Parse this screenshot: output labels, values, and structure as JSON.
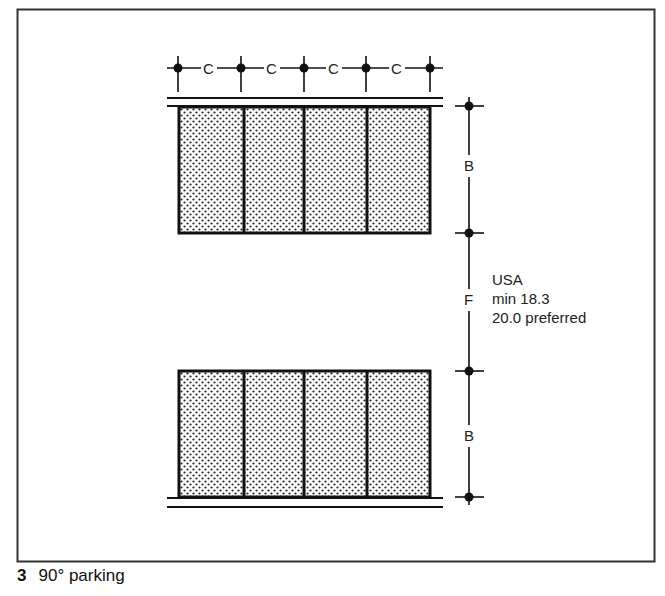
{
  "figure": {
    "number": "3",
    "caption": "90° parking"
  },
  "dimensions": {
    "stall_width_label": "C",
    "stall_depth_label": "B",
    "aisle_width_label": "F",
    "note_lines": [
      "USA",
      "min 18.3",
      "20.0 preferred"
    ]
  },
  "layout": {
    "stalls_per_row": 4,
    "rows": 2,
    "stall_fill": "dotted stipple",
    "line_color": "#111111"
  }
}
